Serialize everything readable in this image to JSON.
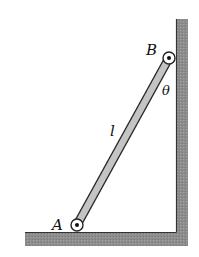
{
  "figure": {
    "type": "mechanics-diagram",
    "labels": {
      "point_a": "A",
      "point_b": "B",
      "length": "l",
      "angle": "θ"
    },
    "colors": {
      "surface_fill": "#8f8f8f",
      "surface_edge": "#3a3a3a",
      "bar_fill": "#c4c4c4",
      "bar_edge": "#2a2a2a",
      "pin_fill": "#ffffff",
      "pin_dot": "#111111"
    }
  }
}
